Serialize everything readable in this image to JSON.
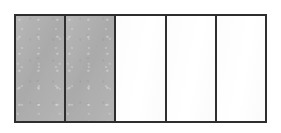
{
  "figure": {
    "name": "fraction-bar-diagram",
    "type": "fraction-bar",
    "total_parts": 5,
    "shaded_parts": 2,
    "fraction_label": "2/5",
    "orientation": "horizontal",
    "background_color": "#ffffff",
    "outline_color": "#2e2e2e",
    "shaded_fill_color": "#b0b0b0",
    "unshaded_fill_color": "#ffffff",
    "cells": [
      {
        "index": "1",
        "state": "shaded",
        "fill": "#b0b0b0",
        "label": ""
      },
      {
        "index": "2",
        "state": "shaded",
        "fill": "#b0b0b0",
        "label": ""
      },
      {
        "index": "3",
        "state": "unshaded",
        "fill": "#ffffff",
        "label": ""
      },
      {
        "index": "4",
        "state": "unshaded",
        "fill": "#ffffff",
        "label": ""
      },
      {
        "index": "5",
        "state": "unshaded",
        "fill": "#ffffff",
        "label": ""
      }
    ]
  },
  "chart_data": {
    "type": "bar",
    "title": "",
    "subtitle": "",
    "xlabel": "",
    "ylabel": "",
    "categories": [
      "1",
      "2",
      "3",
      "4",
      "5"
    ],
    "values": [
      1,
      1,
      0,
      0,
      0
    ],
    "series": [
      {
        "name": "shaded",
        "values": [
          1,
          1,
          0,
          0,
          0
        ]
      }
    ],
    "legend": [],
    "legend_position": "none",
    "grid": false,
    "annotations": []
  }
}
